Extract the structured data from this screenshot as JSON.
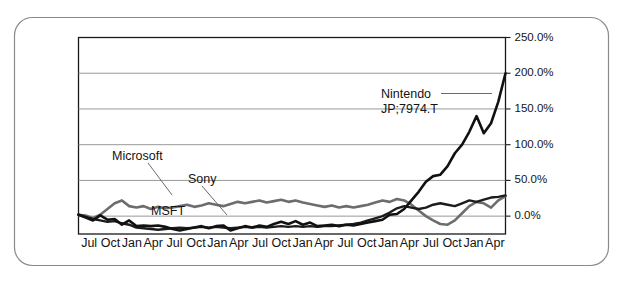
{
  "figure": {
    "frame_color": "#8a8a8a",
    "background": "#ffffff"
  },
  "annotations": {
    "nintendo_label": "Nintendo",
    "nintendo_ticker": "JP;7974.T",
    "microsoft_label": "Microsoft",
    "microsoft_ticker": "MSFT",
    "sony_label": "Sony"
  },
  "chart_data": {
    "type": "line",
    "title": "",
    "xlabel": "",
    "ylabel": "",
    "ylim": [
      -25,
      250
    ],
    "yticks": [
      0,
      50,
      100,
      150,
      200,
      250
    ],
    "ytick_labels": [
      "0.0%",
      "50.0%",
      "100.0%",
      "150.0%",
      "200.0%",
      "250.0%"
    ],
    "grid": true,
    "legend_position": "inline-annotations",
    "xtick_labels": [
      "Jul",
      "Oct",
      "Jan",
      "Apr",
      "Jul",
      "Oct",
      "Jan",
      "Apr",
      "Jul",
      "Oct",
      "Jan",
      "Apr",
      "Jul",
      "Oct",
      "Jan",
      "Apr",
      "Jul",
      "Oct",
      "Jan",
      "Apr"
    ],
    "x": [
      0,
      1,
      2,
      3,
      4,
      5,
      6,
      7,
      8,
      9,
      10,
      11,
      12,
      13,
      14,
      15,
      16,
      17,
      18,
      19,
      20,
      21,
      22,
      23,
      24,
      25,
      26,
      27,
      28,
      29,
      30,
      31,
      32,
      33,
      34,
      35,
      36,
      37,
      38,
      39,
      40,
      41,
      42,
      43,
      44,
      45,
      46,
      47,
      48,
      49,
      50,
      51,
      52,
      53,
      54,
      55,
      56,
      57,
      58,
      59
    ],
    "series": [
      {
        "name": "Nintendo",
        "ticker": "JP;7974.T",
        "color": "#111111",
        "values": [
          2,
          -2,
          -6,
          1,
          -5,
          -4,
          -12,
          -6,
          -14,
          -13,
          -14,
          -13,
          -15,
          -18,
          -20,
          -18,
          -16,
          -14,
          -17,
          -14,
          -13,
          -20,
          -17,
          -14,
          -16,
          -13,
          -15,
          -11,
          -8,
          -11,
          -7,
          -12,
          -9,
          -14,
          -13,
          -12,
          -14,
          -12,
          -13,
          -11,
          -9,
          -7,
          -5,
          2,
          3,
          10,
          22,
          34,
          48,
          56,
          58,
          70,
          88,
          100,
          118,
          140,
          116,
          130,
          160,
          200
        ]
      },
      {
        "name": "Sony",
        "color": "#1c1c1c",
        "values": [
          2,
          -1,
          -4,
          -6,
          -8,
          -7,
          -10,
          -12,
          -16,
          -17,
          -18,
          -19,
          -18,
          -17,
          -16,
          -17,
          -16,
          -15,
          -16,
          -15,
          -16,
          -17,
          -16,
          -15,
          -16,
          -15,
          -16,
          -15,
          -14,
          -15,
          -14,
          -15,
          -14,
          -15,
          -14,
          -14,
          -13,
          -12,
          -11,
          -9,
          -6,
          -3,
          0,
          5,
          11,
          14,
          12,
          10,
          12,
          16,
          18,
          16,
          14,
          18,
          22,
          20,
          23,
          26,
          27,
          29
        ]
      },
      {
        "name": "Microsoft",
        "ticker": "MSFT",
        "color": "#6d6d6d",
        "values": [
          2,
          1,
          -3,
          2,
          10,
          18,
          22,
          14,
          12,
          14,
          10,
          13,
          11,
          12,
          14,
          16,
          13,
          15,
          18,
          16,
          14,
          17,
          20,
          18,
          20,
          22,
          19,
          21,
          23,
          20,
          22,
          19,
          17,
          15,
          13,
          15,
          12,
          14,
          12,
          14,
          16,
          19,
          22,
          20,
          24,
          22,
          16,
          8,
          0,
          -6,
          -11,
          -12,
          -6,
          4,
          14,
          20,
          18,
          12,
          22,
          28
        ]
      }
    ]
  }
}
